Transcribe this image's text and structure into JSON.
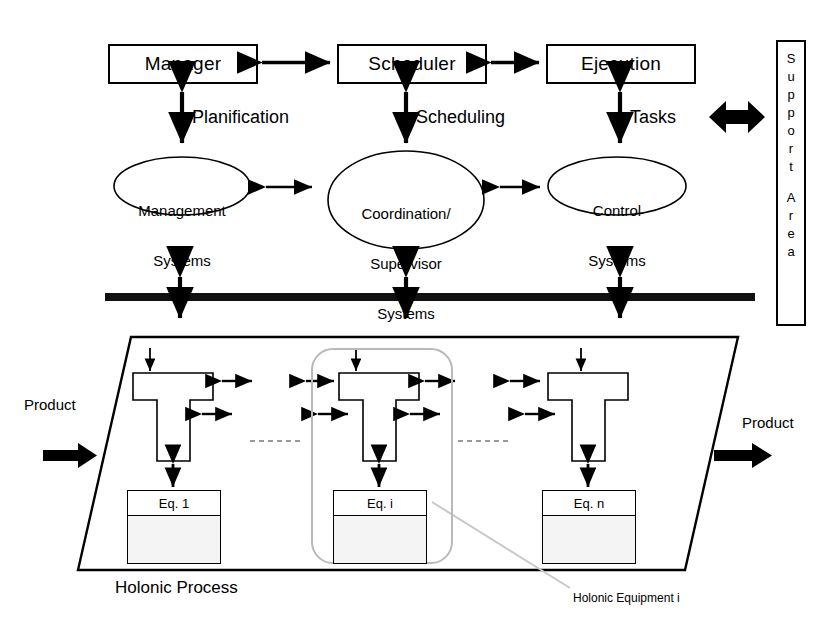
{
  "diagram": {
    "title_caption": "Holonic Process",
    "annotation": "Holonic Equipment i",
    "colors": {
      "stroke": "#000000",
      "highlight": "#b9b9b9",
      "equipment_fill": "#f4f4f4",
      "background": "#ffffff",
      "leader": "#c8c8c8"
    }
  },
  "top_row": {
    "boxes": [
      {
        "label": "Manager"
      },
      {
        "label": "Scheduler"
      },
      {
        "label": "Ejecution"
      }
    ],
    "connector_icons": [
      "double-arrow-horizontal-icon",
      "double-arrow-horizontal-icon"
    ]
  },
  "vertical_links": [
    {
      "label": "Planification",
      "icon": "double-arrow-vertical-icon"
    },
    {
      "label": "Scheduling",
      "icon": "double-arrow-vertical-icon"
    },
    {
      "label": "Tasks",
      "icon": "double-arrow-vertical-icon"
    }
  ],
  "systems": {
    "ellipses": [
      {
        "lines": [
          "Management",
          "Systems"
        ]
      },
      {
        "lines": [
          "Coordination/",
          "Supervisor",
          "Systems"
        ]
      },
      {
        "lines": [
          "Control",
          "Systems"
        ]
      }
    ],
    "connector_icons": [
      "double-arrow-horizontal-icon",
      "double-arrow-horizontal-icon"
    ]
  },
  "support_area": {
    "letters": [
      "S",
      "u",
      "p",
      "p",
      "o",
      "r",
      "t",
      " ",
      "A",
      "r",
      "e",
      "a"
    ],
    "text": "Support Area",
    "block_arrow_icon": "block-double-arrow-horizontal-icon"
  },
  "bus": {
    "icon": "thick-horizontal-bus-bar",
    "crossing_icons": [
      "double-arrow-vertical-icon",
      "double-arrow-vertical-icon",
      "double-arrow-vertical-icon"
    ]
  },
  "process": {
    "shape": "parallelogram",
    "product_in": {
      "label": "Product",
      "icon": "thick-arrow-right-icon"
    },
    "product_out": {
      "label": "Product",
      "icon": "thick-arrow-right-icon"
    },
    "units": [
      {
        "equipment_label": "Eq.  1",
        "holon_icon": "t-shape-holon",
        "highlighted": false
      },
      {
        "equipment_label": "Eq. i",
        "holon_icon": "t-shape-holon",
        "highlighted": true
      },
      {
        "equipment_label": "Eq. n",
        "holon_icon": "t-shape-holon",
        "highlighted": false
      }
    ],
    "separator_icons": [
      "dashed-line-icon",
      "dashed-line-icon"
    ]
  }
}
